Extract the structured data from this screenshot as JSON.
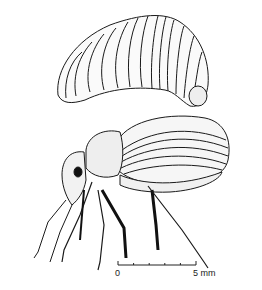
{
  "illustration": {
    "subjects": [
      "larva",
      "adult weevil"
    ],
    "scale_bar": {
      "start_label": "0",
      "end_label": "5 mm",
      "ticks": 5
    }
  }
}
